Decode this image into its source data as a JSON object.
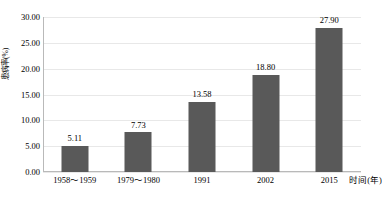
{
  "chart_data": {
    "type": "bar",
    "title": "",
    "categories": [
      "1958～1959",
      "1979～1980",
      "1991",
      "2002",
      "2015"
    ],
    "values": [
      5.11,
      7.73,
      13.58,
      18.8,
      27.9
    ],
    "value_labels": [
      "5.11",
      "7.73",
      "13.58",
      "18.80",
      "27.90"
    ],
    "xlabel": "时间(年)",
    "ylabel": "患病率(%)",
    "ylim": [
      0,
      30
    ],
    "ytick_step": 5,
    "ytick_labels": [
      "30.00",
      "25.00",
      "20.00",
      "15.00",
      "10.00",
      "5.00",
      "0.00"
    ],
    "ytick_values": [
      30,
      25,
      20,
      15,
      10,
      5,
      0
    ],
    "grid": true,
    "legend": false,
    "bar_color": "#595959",
    "grid_color": "#e8e8e8",
    "axis_color": "#b9b9b9",
    "background": "#ffffff"
  }
}
